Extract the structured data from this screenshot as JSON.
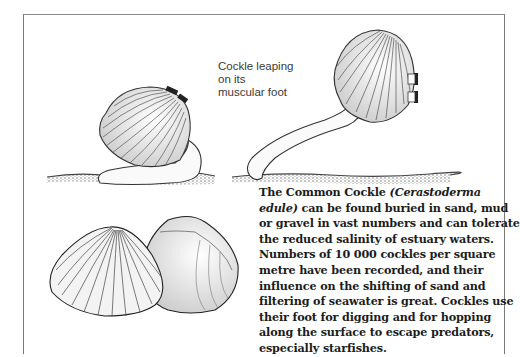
{
  "figure": {
    "label_lines": [
      "Cockle leaping",
      "on its",
      "muscular foot"
    ],
    "caption": {
      "lines": [
        {
          "pre": "The Common Cockle ",
          "italic": "(Cerastoderma",
          "post": ""
        },
        {
          "pre": "",
          "italic": "edule)",
          "post": " can be found buried in sand, mud"
        },
        {
          "pre": "or gravel in vast numbers and can tolerate",
          "italic": "",
          "post": ""
        },
        {
          "pre": "the reduced salinity of estuary waters.",
          "italic": "",
          "post": ""
        },
        {
          "pre": "Numbers of 10 000 cockles per square",
          "italic": "",
          "post": ""
        },
        {
          "pre": "metre have been recorded, and their",
          "italic": "",
          "post": ""
        },
        {
          "pre": "influence on the shifting of sand and",
          "italic": "",
          "post": ""
        },
        {
          "pre": "filtering of seawater is great. Cockles use",
          "italic": "",
          "post": ""
        },
        {
          "pre": "their foot for digging and for hopping",
          "italic": "",
          "post": ""
        },
        {
          "pre": "along the surface to escape predators,",
          "italic": "",
          "post": ""
        },
        {
          "pre": "especially starfishes.",
          "italic": "",
          "post": ""
        }
      ]
    },
    "illustrations": [
      {
        "name": "cockle-crawling-illustration"
      },
      {
        "name": "cockle-leaping-illustration"
      },
      {
        "name": "cockle-shells-illustration"
      }
    ],
    "colors": {
      "border": "#7a7a7a",
      "text": "#1c1c1c",
      "label": "#3a3a3a",
      "sand": "#6a6a6a"
    }
  }
}
